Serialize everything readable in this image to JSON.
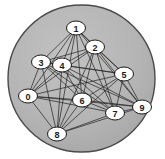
{
  "figure": {
    "type": "graph-diagram",
    "background_color": "#ffffff"
  },
  "disk": {
    "name": "enclosing-circle",
    "cx": 81.5,
    "cy": 78.5,
    "r": 73.5,
    "fill_color": "#b5b5b5",
    "stroke_color": "#4a4a4a",
    "stroke_width": 1.4
  },
  "graph": {
    "kind": "complete",
    "node_count": 10,
    "edge_count": 45,
    "edge_color": "#2b2b2b",
    "edge_width": 0.75,
    "node_fill_color": "#ffffff",
    "node_stroke_color": "#1a1a1a",
    "node_rx": 9.5,
    "node_ry": 7,
    "nodes": [
      {
        "id": 0,
        "label": "0",
        "x": 28,
        "y": 96
      },
      {
        "id": 1,
        "label": "1",
        "x": 76,
        "y": 28
      },
      {
        "id": 2,
        "label": "2",
        "x": 95,
        "y": 47
      },
      {
        "id": 3,
        "label": "3",
        "x": 41,
        "y": 62
      },
      {
        "id": 4,
        "label": "4",
        "x": 62,
        "y": 65
      },
      {
        "id": 5,
        "label": "5",
        "x": 124,
        "y": 74
      },
      {
        "id": 6,
        "label": "6",
        "x": 82,
        "y": 100
      },
      {
        "id": 7,
        "label": "7",
        "x": 115,
        "y": 113
      },
      {
        "id": 8,
        "label": "8",
        "x": 57,
        "y": 134
      },
      {
        "id": 9,
        "label": "9",
        "x": 142,
        "y": 107
      }
    ],
    "edges": [
      [
        0,
        1
      ],
      [
        0,
        2
      ],
      [
        0,
        3
      ],
      [
        0,
        4
      ],
      [
        0,
        5
      ],
      [
        0,
        6
      ],
      [
        0,
        7
      ],
      [
        0,
        8
      ],
      [
        0,
        9
      ],
      [
        1,
        2
      ],
      [
        1,
        3
      ],
      [
        1,
        4
      ],
      [
        1,
        5
      ],
      [
        1,
        6
      ],
      [
        1,
        7
      ],
      [
        1,
        8
      ],
      [
        1,
        9
      ],
      [
        2,
        3
      ],
      [
        2,
        4
      ],
      [
        2,
        5
      ],
      [
        2,
        6
      ],
      [
        2,
        7
      ],
      [
        2,
        8
      ],
      [
        2,
        9
      ],
      [
        3,
        4
      ],
      [
        3,
        5
      ],
      [
        3,
        6
      ],
      [
        3,
        7
      ],
      [
        3,
        8
      ],
      [
        3,
        9
      ],
      [
        4,
        5
      ],
      [
        4,
        6
      ],
      [
        4,
        7
      ],
      [
        4,
        8
      ],
      [
        4,
        9
      ],
      [
        5,
        6
      ],
      [
        5,
        7
      ],
      [
        5,
        8
      ],
      [
        5,
        9
      ],
      [
        6,
        7
      ],
      [
        6,
        8
      ],
      [
        6,
        9
      ],
      [
        7,
        8
      ],
      [
        7,
        9
      ],
      [
        8,
        9
      ]
    ]
  }
}
